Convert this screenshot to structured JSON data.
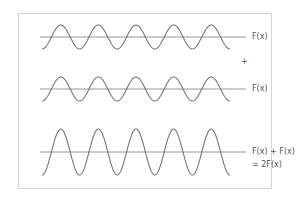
{
  "diagram": {
    "colors": {
      "wave": "#777777",
      "axis": "#8a8a8a",
      "border": "#d4d4d4",
      "text": "#555555"
    },
    "waves": [
      {
        "id": "wave-1",
        "label": "F(x)",
        "baseline_y": 37,
        "amplitude": 12,
        "cycles": 5
      },
      {
        "id": "wave-2",
        "label": "F(x)",
        "baseline_y": 89,
        "amplitude": 12,
        "cycles": 5
      },
      {
        "id": "wave-sum",
        "label_line1": "F(x) + F(x)",
        "label_line2": "= 2F(x)",
        "baseline_y": 152,
        "amplitude": 23,
        "cycles": 5
      }
    ],
    "operator": "+"
  }
}
